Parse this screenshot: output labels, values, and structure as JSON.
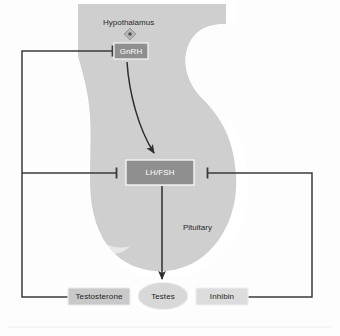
{
  "diagram": {
    "background_color": "#fdfdfd",
    "gland_fill": "#cfcfcf",
    "gland_halo": "#ffffff",
    "line_color": "#3a3a3a",
    "box_fill_dark": "#8f8f8f",
    "box_fill_light": "#c9c9c9",
    "ellipse_fill": "#d8d8d8"
  },
  "structures": {
    "hypothalamus_label": "Hypothalamus",
    "pituitary_label": "Pituitary"
  },
  "nodes": {
    "gnrh": {
      "label": "GnRH",
      "fill": "#8f8f8f",
      "text_color": "#ffffff"
    },
    "lh_fsh": {
      "label": "LH/FSH",
      "fill": "#8f8f8f",
      "text_color": "#ffffff"
    },
    "testes": {
      "label": "Testes",
      "fill": "#d8d8d8",
      "text_color": "#2a2a2a"
    },
    "testosterone": {
      "label": "Testosterone",
      "fill": "#c9c9c9",
      "text_color": "#2a2a2a"
    },
    "inhibin": {
      "label": "Inhibin",
      "fill": "#dcdcdc",
      "text_color": "#2a2a2a"
    }
  },
  "connections": [
    {
      "name": "gnrh-to-lhfsh",
      "from": "GnRH",
      "to": "LH/FSH",
      "type": "stimulatory",
      "style": "curved-arrow"
    },
    {
      "name": "lhfsh-to-testes",
      "from": "LH/FSH",
      "to": "Testes",
      "type": "stimulatory",
      "style": "straight-arrow"
    },
    {
      "name": "testosterone-to-gnrh",
      "from": "Testosterone",
      "to": "GnRH",
      "type": "inhibitory",
      "style": "orthogonal-bar"
    },
    {
      "name": "testosterone-to-lhfsh",
      "from": "Testosterone",
      "to": "LH/FSH",
      "type": "inhibitory",
      "style": "orthogonal-bar"
    },
    {
      "name": "inhibin-to-lhfsh",
      "from": "Inhibin",
      "to": "LH/FSH",
      "type": "inhibitory",
      "style": "orthogonal-bar"
    }
  ],
  "markers": {
    "hypothalamus_diamond": "diamond-marker"
  }
}
